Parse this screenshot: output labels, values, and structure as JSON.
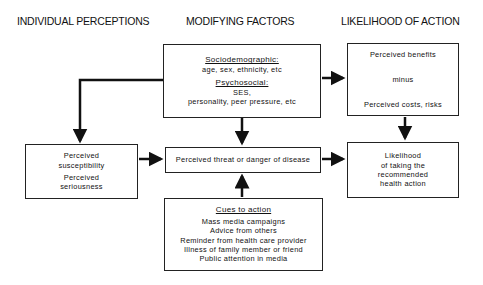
{
  "headings": {
    "individual": "INDIVIDUAL PERCEPTIONS",
    "modifying": "MODIFYING FACTORS",
    "likelihood": "LIKELIHOOD OF ACTION"
  },
  "modifying_box": {
    "sociodemographic_title": "Sociodemographic:",
    "sociodemographic_items": "age, sex, ethnicity, etc",
    "psychosocial_title": "Psychosocial:",
    "psychosocial_line1": "SES,",
    "psychosocial_line2": "personality, peer pressure, etc"
  },
  "benefits_box": {
    "line1": "Perceived benefits",
    "line2": "minus",
    "line3": "Perceived costs, risks"
  },
  "perceptions_box": {
    "line1": "Perceived",
    "line2": "susceptibility",
    "line3": "Perceived",
    "line4": "seriousness"
  },
  "threat_box": {
    "label": "Perceived threat or danger of disease"
  },
  "action_box": {
    "line1": "Likelihood",
    "line2": "of taking the",
    "line3": "recommended",
    "line4": "health action"
  },
  "cues_box": {
    "title": "Cues to action",
    "items": [
      "Mass media campaigns",
      "Advice from others",
      "Reminder from health care provider",
      "Illness of family member or friend",
      "Public attention in media"
    ]
  },
  "colors": {
    "line": "#111111",
    "background": "#ffffff"
  }
}
